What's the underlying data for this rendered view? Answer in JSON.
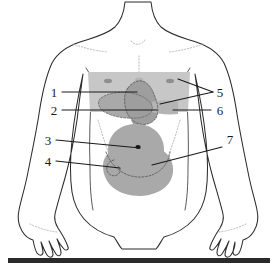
{
  "figure": {
    "view": "anterior torso, line drawing with shaded organ projections",
    "background_color": "#ffffff",
    "outline_color": "#2b2b2b",
    "organ_fill_color": "#a9a9a9",
    "organ_band_color": "#c2c2c2",
    "organ_dash_color": "#6e6e6e",
    "label_color": "#1a1a1a",
    "baseline_bar_color": "#2a2a2a"
  },
  "labels": [
    {
      "id": "1",
      "text": "1",
      "side": "left",
      "x": 54,
      "y": 96,
      "line": [
        [
          62,
          92
        ],
        [
          137,
          92
        ]
      ]
    },
    {
      "id": "2",
      "text": "2",
      "side": "left",
      "x": 54,
      "y": 114,
      "line": [
        [
          62,
          110
        ],
        [
          157,
          110
        ]
      ]
    },
    {
      "id": "3",
      "text": "3",
      "side": "left",
      "x": 48,
      "y": 144,
      "line": [
        [
          56,
          140
        ],
        [
          140,
          148
        ]
      ]
    },
    {
      "id": "4",
      "text": "4",
      "side": "left",
      "x": 48,
      "y": 165,
      "line": [
        [
          56,
          161
        ],
        [
          120,
          168
        ]
      ]
    },
    {
      "id": "5",
      "text": "5",
      "side": "right",
      "x": 218,
      "y": 96,
      "line": [
        [
          213,
          92
        ],
        [
          178,
          80
        ]
      ]
    },
    {
      "id": "5b",
      "text": "",
      "side": "right",
      "x": 0,
      "y": 0,
      "line": [
        [
          213,
          92
        ],
        [
          160,
          104
        ]
      ]
    },
    {
      "id": "6",
      "text": "6",
      "side": "right",
      "x": 218,
      "y": 114,
      "line": [
        [
          211,
          110
        ],
        [
          173,
          110
        ]
      ]
    },
    {
      "id": "7",
      "text": "7",
      "side": "right",
      "x": 228,
      "y": 143,
      "line": [
        [
          222,
          147
        ],
        [
          152,
          165
        ]
      ]
    }
  ],
  "baseline_bar": {
    "name": "bottom-rule",
    "x": 8,
    "y": 258,
    "width": 262,
    "height": 5
  }
}
